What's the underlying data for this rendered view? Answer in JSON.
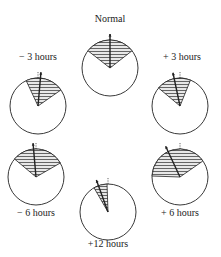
{
  "diagram": {
    "type": "circular sector phase diagrams",
    "panels": [
      {
        "id": "normal",
        "label": "Normal",
        "cx": 110,
        "cy": 68,
        "r": 28,
        "sector_start_deg": -52,
        "sector_end_deg": 52,
        "arrow_deg": 0,
        "label_x": 110,
        "label_y": 19
      },
      {
        "id": "minus3",
        "label": "− 3 hours",
        "cx": 38,
        "cy": 106,
        "r": 28,
        "sector_start_deg": -25,
        "sector_end_deg": 55,
        "arrow_deg": 5,
        "label_x": 38,
        "label_y": 57
      },
      {
        "id": "plus3",
        "label": "+ 3 hours",
        "cx": 180,
        "cy": 106,
        "r": 28,
        "sector_start_deg": -50,
        "sector_end_deg": 22,
        "arrow_deg": -12,
        "label_x": 182,
        "label_y": 57
      },
      {
        "id": "minus6",
        "label": "− 6 hours",
        "cx": 36,
        "cy": 177,
        "r": 28,
        "sector_start_deg": -50,
        "sector_end_deg": 60,
        "arrow_deg": -5,
        "label_x": 36,
        "label_y": 213
      },
      {
        "id": "plus6",
        "label": "+ 6 hours",
        "cx": 180,
        "cy": 177,
        "r": 28,
        "sector_start_deg": -88,
        "sector_end_deg": 55,
        "arrow_deg": -25,
        "label_x": 180,
        "label_y": 213
      },
      {
        "id": "plus12",
        "label": "+12 hours",
        "cx": 108,
        "cy": 212,
        "r": 28,
        "sector_start_deg": -30,
        "sector_end_deg": -2,
        "arrow_deg": -20,
        "label_x": 108,
        "label_y": 244
      }
    ]
  },
  "colors": {
    "stroke": "#222222",
    "hatch": "#444444",
    "background": "#ffffff"
  }
}
